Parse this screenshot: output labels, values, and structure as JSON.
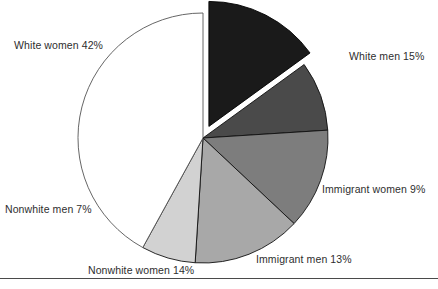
{
  "chart_data": {
    "type": "pie",
    "title": "",
    "subtitle": "",
    "xlabel": "",
    "ylabel": "",
    "legend_position": "none",
    "grid": false,
    "labels_show_percent": true,
    "total_percent": 100,
    "center": {
      "x": 203,
      "y": 138
    },
    "radius": 125,
    "start_angle_deg": 0,
    "direction": "clockwise",
    "categories": [
      "White men",
      "Immigrant women",
      "Immigrant men",
      "Nonwhite women",
      "Nonwhite men",
      "White women"
    ],
    "values": [
      15,
      9,
      13,
      14,
      7,
      42
    ],
    "slices": [
      {
        "name": "White men",
        "value": 15,
        "label": "White men 15%",
        "color": "#1a1a1a",
        "stroke": "#000000",
        "exploded": true,
        "explode_offset": 13
      },
      {
        "name": "Immigrant women",
        "value": 9,
        "label": "Immigrant women 9%",
        "color": "#4a4a4a",
        "stroke": "#111111",
        "exploded": false,
        "explode_offset": 0
      },
      {
        "name": "Immigrant men",
        "value": 13,
        "label": "Immigrant men 13%",
        "color": "#7d7d7d",
        "stroke": "#111111",
        "exploded": false,
        "explode_offset": 0
      },
      {
        "name": "Nonwhite women",
        "value": 14,
        "label": "Nonwhite women 14%",
        "color": "#a8a8a8",
        "stroke": "#111111",
        "exploded": false,
        "explode_offset": 0
      },
      {
        "name": "Nonwhite men",
        "value": 7,
        "label": "Nonwhite men 7%",
        "color": "#d2d2d2",
        "stroke": "#111111",
        "exploded": false,
        "explode_offset": 0
      },
      {
        "name": "White women",
        "value": 42,
        "label": "White women 42%",
        "color": "#ffffff",
        "stroke": "#555555",
        "exploded": false,
        "explode_offset": 0
      }
    ]
  },
  "labels": {
    "white_women": "White women 42%",
    "white_men": "White men 15%",
    "immigrant_women": "Immigrant women 9%",
    "immigrant_men": "Immigrant men 13%",
    "nonwhite_women": "Nonwhite women 14%",
    "nonwhite_men": "Nonwhite men 7%"
  },
  "colors": {
    "white_men": "#1a1a1a",
    "immigrant_women": "#4a4a4a",
    "immigrant_men": "#7d7d7d",
    "nonwhite_women": "#a8a8a8",
    "nonwhite_men": "#d2d2d2",
    "white_women": "#ffffff",
    "rule": "#4a4a4a",
    "text": "#2e2e2e",
    "background": "#ffffff"
  }
}
